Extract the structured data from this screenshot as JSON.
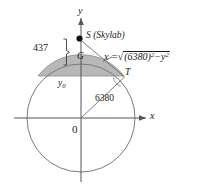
{
  "figure": {
    "colors": {
      "stroke": "#6f6f6f",
      "axis": "#555555",
      "shade_fill": "#b8b8b8",
      "shade_stroke": "#8a8a8a",
      "text": "#1a1a1a",
      "point_fill": "#111111",
      "background": "#ffffff"
    },
    "axes": {
      "y_label": "y",
      "x_label": "x",
      "origin_label": "0"
    },
    "points": {
      "skylab_label": "S (Skylab)",
      "ground_label": "G",
      "tangent_label": "T"
    },
    "measures": {
      "altitude": "437",
      "radius": "6380",
      "lower_bound_label": "y",
      "lower_bound_sub": "0"
    },
    "equation": {
      "lhs": "x =",
      "radical_sign": "√",
      "inner_base": "(6380)",
      "inner_exp": "2",
      "minus": "−",
      "var": "y",
      "var_exp": "2",
      "full_text": "x = √((6380)² − y²)"
    },
    "geometry": {
      "circle_center_x": 81,
      "circle_center_y": 118,
      "circle_radius": 54,
      "skylab_x": 79,
      "skylab_y": 38,
      "tangent_x": 123,
      "tangent_y": 76,
      "chord_y": 76
    }
  }
}
